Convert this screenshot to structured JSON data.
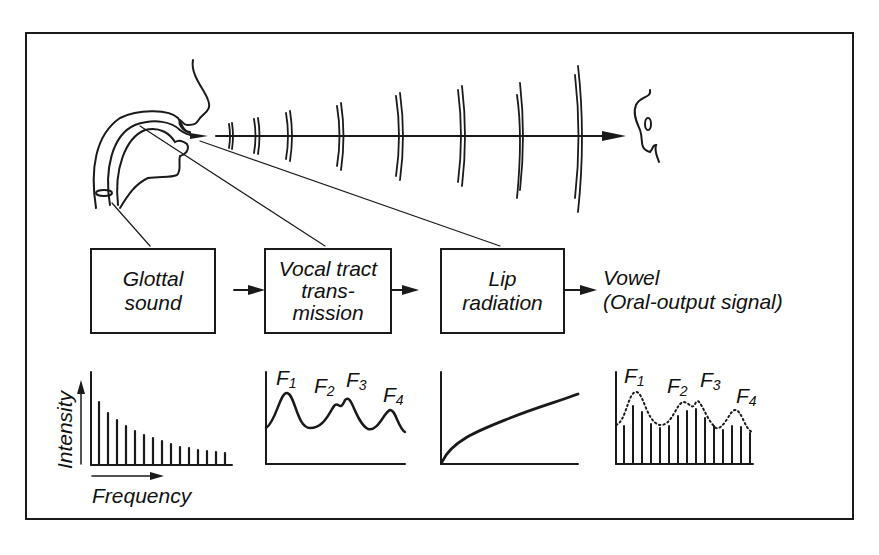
{
  "diagram": {
    "blocks": [
      {
        "id": "glottal",
        "label_line1": "Glottal",
        "label_line2": "sound"
      },
      {
        "id": "vocal_tract",
        "label_line1": "Vocal tract",
        "label_line2": "trans-",
        "label_line3": "mission"
      },
      {
        "id": "lip",
        "label_line1": "Lip",
        "label_line2": "radiation"
      }
    ],
    "output": {
      "label_line1": "Vowel",
      "label_line2": "(Oral-output signal)"
    },
    "graphs": {
      "source_spectrum": {
        "ylabel": "Intensity",
        "xlabel": "Frequency"
      },
      "transfer_function": {
        "formants": [
          "F",
          "F",
          "F",
          "F"
        ],
        "formant_subs": [
          "1",
          "2",
          "3",
          "4"
        ]
      },
      "radiation": {},
      "output_spectrum": {
        "formants": [
          "F",
          "F",
          "F",
          "F"
        ],
        "formant_subs": [
          "1",
          "2",
          "3",
          "4"
        ]
      }
    },
    "colors": {
      "ink": "#1a1a1a",
      "background": "#ffffff"
    }
  }
}
